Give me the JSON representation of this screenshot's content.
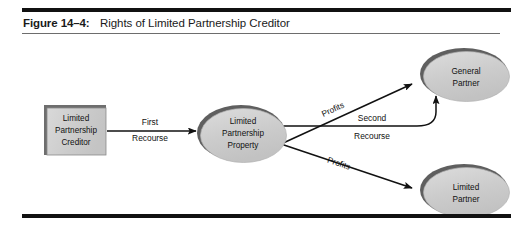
{
  "figure": {
    "label": "Figure 14–4:",
    "title": "Rights of Limited Partnership Creditor"
  },
  "colors": {
    "rule": "#111111",
    "thin_rule": "#6d6d6d",
    "shape_fill": "#c9c9c9",
    "shape_fill_light": "#d8d8d8",
    "shape_edge_dark": "#555555",
    "shape_outline": "#3a3a3a",
    "arrow": "#111111",
    "text": "#111111"
  },
  "nodes": [
    {
      "id": "limited-partnership-creditor",
      "shape": "rect",
      "lines": [
        "Limited",
        "Partnership",
        "Creditor"
      ]
    },
    {
      "id": "limited-partnership-property",
      "shape": "ellipse",
      "lines": [
        "Limited",
        "Partnership",
        "Property"
      ]
    },
    {
      "id": "general-partner",
      "shape": "ellipse",
      "lines": [
        "General",
        "Partner"
      ]
    },
    {
      "id": "limited-partner",
      "shape": "ellipse",
      "lines": [
        "Limited",
        "Partner"
      ]
    }
  ],
  "edges": [
    {
      "id": "first-recourse",
      "from": "limited-partnership-creditor",
      "to": "limited-partnership-property",
      "label_above": "First",
      "label_below": "Recourse",
      "style": "straight-horizontal"
    },
    {
      "id": "profits-to-general-partner",
      "from": "limited-partnership-property",
      "to": "general-partner",
      "label": "Profits",
      "style": "diagonal-up"
    },
    {
      "id": "second-recourse",
      "from": "limited-partnership-property",
      "to": "general-partner",
      "label_above": "Second",
      "label_below": "Recourse",
      "style": "horizontal-then-curve-up"
    },
    {
      "id": "profits-to-limited-partner",
      "from": "limited-partnership-property",
      "to": "limited-partner",
      "label": "Profits",
      "style": "diagonal-down"
    }
  ]
}
